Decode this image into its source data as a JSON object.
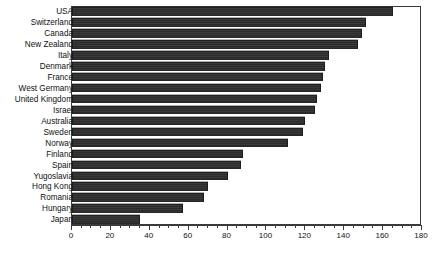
{
  "chart_data": {
    "type": "bar",
    "orientation": "horizontal",
    "title": "",
    "subtitle": "",
    "xlabel": "",
    "ylabel": "",
    "xlim": [
      0,
      180
    ],
    "ylim": null,
    "grid": false,
    "legend": null,
    "xticks": [
      0,
      20,
      40,
      60,
      80,
      100,
      120,
      140,
      160,
      180
    ],
    "xtick_labels": [
      "0",
      "20",
      "40",
      "60",
      "80",
      "100",
      "120",
      "140",
      "160",
      "180"
    ],
    "minor_tick_interval": 5,
    "bar_color": "#333333",
    "axis_color": "#3a3a3a",
    "text_color": "#111111",
    "categories": [
      "USA",
      "Switzerland",
      "Canada",
      "New Zealand",
      "Italy",
      "Denmark",
      "France",
      "West Germany",
      "United Kingdom",
      "Israel",
      "Australia",
      "Sweden",
      "Norway",
      "Finland",
      "Spain",
      "Yugoslavia",
      "Hong Kong",
      "Romania",
      "Hungary",
      "Japan"
    ],
    "values": [
      165,
      151,
      149,
      147,
      132,
      130,
      129,
      128,
      126,
      125,
      120,
      119,
      111,
      88,
      87,
      80,
      70,
      68,
      57,
      35
    ],
    "annotation": ""
  }
}
